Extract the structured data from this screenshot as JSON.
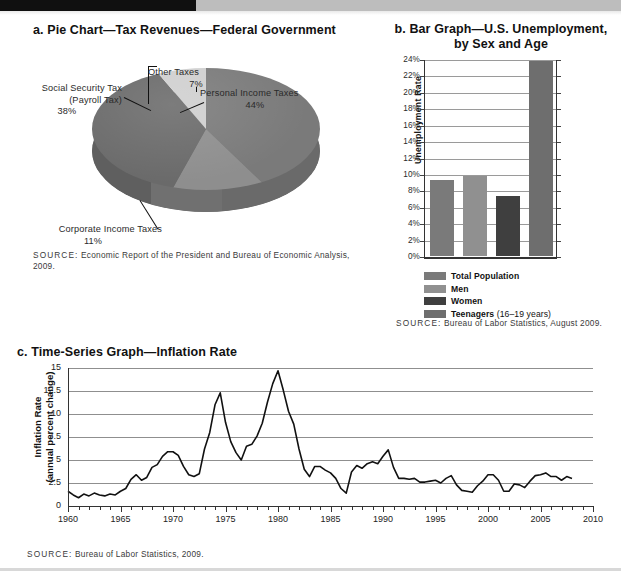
{
  "page": {
    "top_bar_color": "#101010",
    "band_color": "#bdbdbd"
  },
  "pie_panel": {
    "title": "a. Pie Chart—Tax Revenues—Federal Government",
    "source_label": "SOURCE:",
    "source_text": " Economic Report of the President and Bureau of Economic Analysis, 2009.",
    "labels": {
      "social": "Social Security Tax–\n(Payroll Tax)",
      "social_line1": "Social Security Tax",
      "social_line2": "(Payroll Tax)",
      "social_pct": "38%",
      "other": "Other Taxes",
      "other_pct": "7%",
      "personal": "Personal Income Taxes",
      "personal_pct": "44%",
      "corporate": "Corporate Income Taxes",
      "corporate_pct": "11%"
    }
  },
  "bar_panel": {
    "title_line1": "b. Bar Graph—U.S. Unemployment,",
    "title_line2": "by Sex and Age",
    "ylabel": "Unemployment Rate",
    "source_label": "SOURCE:",
    "source_text": " Bureau of Labor Statistics, August 2009.",
    "legend": [
      {
        "label": "Total Population",
        "note": "",
        "color": "#7a7a7a"
      },
      {
        "label": "Men",
        "note": "",
        "color": "#909090"
      },
      {
        "label": "Women",
        "note": "",
        "color": "#3f3f3f"
      },
      {
        "label": "Teenagers",
        "note": " (16–19 years)",
        "color": "#6e6e6e"
      }
    ]
  },
  "ts_panel": {
    "title": "c. Time-Series Graph—Inflation Rate",
    "ylabel_line1": "Inflation Rate",
    "ylabel_line2": "(annual percent change)",
    "source_label": "SOURCE:",
    "source_text": " Bureau of Labor Statistics, 2009."
  },
  "chart_data": [
    {
      "type": "pie",
      "title": "a. Pie Chart—Tax Revenues—Federal Government",
      "slices": [
        {
          "label": "Personal Income Taxes",
          "value": 44,
          "display": "44%",
          "color": "#7a7a7a"
        },
        {
          "label": "Corporate Income Taxes",
          "value": 11,
          "display": "11%",
          "color": "#8e8e8e"
        },
        {
          "label": "Social Security Tax (Payroll Tax)",
          "value": 38,
          "display": "38%",
          "color": "#6a6a6a"
        },
        {
          "label": "Other Taxes",
          "value": 7,
          "display": "7%",
          "color": "#cfcfcf"
        }
      ],
      "legend_position": "callout-labels",
      "source": "SOURCE: Economic Report of the President and Bureau of Economic Analysis, 2009."
    },
    {
      "type": "bar",
      "title": "b. Bar Graph—U.S. Unemployment, by Sex and Age",
      "categories": [
        "Total Population",
        "Men",
        "Women",
        "Teenagers (16–19 years)"
      ],
      "values": [
        9.2,
        9.7,
        7.3,
        23.8
      ],
      "colors": [
        "#7a7a7a",
        "#909090",
        "#3f3f3f",
        "#6e6e6e"
      ],
      "xlabel": "",
      "ylabel": "Unemployment Rate",
      "ylim": [
        0,
        24
      ],
      "ytick_step": 2,
      "yticks": [
        "0%",
        "2%",
        "4%",
        "6%",
        "8%",
        "10%",
        "12%",
        "14%",
        "16%",
        "18%",
        "20%",
        "22%",
        "24%"
      ],
      "grid": true,
      "legend_position": "bottom-left",
      "source": "SOURCE: Bureau of Labor Statistics, August 2009."
    },
    {
      "type": "line",
      "title": "c. Time-Series Graph—Inflation Rate",
      "xlabel": "",
      "ylabel": "Inflation Rate (annual percent change)",
      "xlim": [
        1960,
        2010
      ],
      "ylim": [
        0,
        15
      ],
      "yticks": [
        "0",
        "2.5",
        "5",
        "7.5",
        "10",
        "12.5",
        "15"
      ],
      "ytick_values": [
        0,
        2.5,
        5,
        7.5,
        10,
        12.5,
        15
      ],
      "xticks": [
        1960,
        1965,
        1970,
        1975,
        1980,
        1985,
        1990,
        1995,
        2000,
        2005,
        2010
      ],
      "xtick_minor_step": 1,
      "grid": true,
      "legend_position": "none",
      "series": [
        {
          "name": "Inflation Rate",
          "color": "#111111",
          "x": [
            1960.0,
            1960.5,
            1961.0,
            1961.5,
            1962.0,
            1962.5,
            1963.0,
            1963.5,
            1964.0,
            1964.5,
            1965.0,
            1965.5,
            1966.0,
            1966.5,
            1967.0,
            1967.5,
            1968.0,
            1968.5,
            1969.0,
            1969.5,
            1970.0,
            1970.5,
            1971.0,
            1971.5,
            1972.0,
            1972.5,
            1973.0,
            1973.5,
            1974.0,
            1974.5,
            1975.0,
            1975.5,
            1976.0,
            1976.5,
            1977.0,
            1977.5,
            1978.0,
            1978.5,
            1979.0,
            1979.5,
            1980.0,
            1980.5,
            1981.0,
            1981.5,
            1982.0,
            1982.5,
            1983.0,
            1983.5,
            1984.0,
            1984.5,
            1985.0,
            1985.5,
            1986.0,
            1986.5,
            1987.0,
            1987.5,
            1988.0,
            1988.5,
            1989.0,
            1989.5,
            1990.0,
            1990.5,
            1991.0,
            1991.5,
            1992.0,
            1992.5,
            1993.0,
            1993.5,
            1994.0,
            1994.5,
            1995.0,
            1995.5,
            1996.0,
            1996.5,
            1997.0,
            1997.5,
            1998.0,
            1998.5,
            1999.0,
            1999.5,
            2000.0,
            2000.5,
            2001.0,
            2001.5,
            2002.0,
            2002.5,
            2003.0,
            2003.5,
            2004.0,
            2004.5,
            2005.0,
            2005.5,
            2006.0,
            2006.5,
            2007.0,
            2007.5,
            2008.0
          ],
          "y": [
            1.6,
            1.2,
            0.9,
            1.3,
            1.1,
            1.4,
            1.2,
            1.1,
            1.3,
            1.2,
            1.6,
            1.9,
            2.9,
            3.4,
            2.8,
            3.1,
            4.2,
            4.5,
            5.4,
            5.9,
            5.9,
            5.5,
            4.3,
            3.4,
            3.2,
            3.5,
            6.2,
            8.0,
            11.0,
            12.3,
            9.1,
            7.0,
            5.8,
            5.0,
            6.5,
            6.7,
            7.6,
            9.0,
            11.3,
            13.3,
            14.7,
            12.6,
            10.3,
            8.9,
            6.2,
            4.0,
            3.2,
            4.3,
            4.3,
            3.9,
            3.6,
            3.0,
            1.9,
            1.4,
            3.7,
            4.4,
            4.1,
            4.6,
            4.8,
            4.6,
            5.4,
            6.1,
            4.2,
            3.0,
            3.0,
            2.9,
            3.0,
            2.6,
            2.6,
            2.7,
            2.8,
            2.5,
            3.0,
            3.3,
            2.3,
            1.7,
            1.6,
            1.5,
            2.2,
            2.7,
            3.4,
            3.4,
            2.8,
            1.6,
            1.6,
            2.4,
            2.3,
            2.0,
            2.7,
            3.3,
            3.4,
            3.6,
            3.2,
            3.2,
            2.8,
            3.2,
            3.0
          ]
        }
      ],
      "source": "SOURCE: Bureau of Labor Statistics, 2009."
    }
  ]
}
